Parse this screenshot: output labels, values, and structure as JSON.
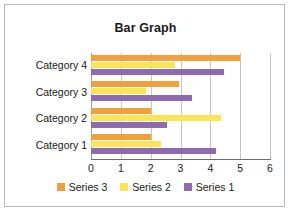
{
  "chart_data": {
    "type": "bar",
    "orientation": "horizontal",
    "title": "Bar Graph",
    "xlabel": "",
    "ylabel": "",
    "xlim": [
      0,
      6
    ],
    "xticks": [
      0,
      1,
      2,
      3,
      4,
      5,
      6
    ],
    "xtick_labels": [
      "0",
      "1",
      "2",
      "3",
      "4",
      "5",
      "6"
    ],
    "grid": true,
    "grid_axis": "x",
    "legend_position": "bottom",
    "categories": [
      "Category 1",
      "Category 2",
      "Category 3",
      "Category 4"
    ],
    "category_order_top_to_bottom": [
      "Category 4",
      "Category 3",
      "Category 2",
      "Category 1"
    ],
    "series": [
      {
        "name": "Series 3",
        "color": "#F2A03F",
        "values": [
          2.0,
          2.0,
          2.95,
          5.0
        ]
      },
      {
        "name": "Series 2",
        "color": "#FBE455",
        "values": [
          2.35,
          4.35,
          1.85,
          2.8
        ]
      },
      {
        "name": "Series 1",
        "color": "#8D6BAE",
        "values": [
          4.2,
          2.55,
          3.4,
          4.45
        ]
      }
    ],
    "legend": [
      {
        "label": "Series 3",
        "color": "#F2A03F"
      },
      {
        "label": "Series 2",
        "color": "#FBE455"
      },
      {
        "label": "Series 1",
        "color": "#8D6BAE"
      }
    ]
  },
  "colors": {
    "series_3": "#F2A03F",
    "series_2": "#FBE455",
    "series_1": "#8D6BAE",
    "gridline": "#c6c6c6",
    "axis": "#6e6e6e",
    "border": "#b9b9b9",
    "text": "#1a1a1a",
    "background": "#ffffff"
  }
}
